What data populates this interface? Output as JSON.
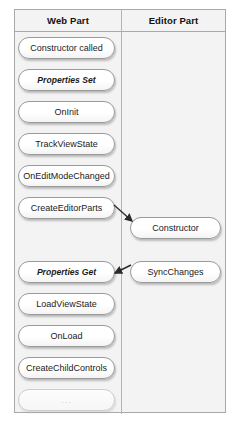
{
  "top_caption_fragment": "",
  "columns": {
    "left_header": "Web Part",
    "right_header": "Editor Part"
  },
  "web_part_steps": [
    {
      "label": "Constructor called",
      "style": "normal",
      "top": 27
    },
    {
      "label": "Properties Set",
      "style": "italic",
      "top": 59
    },
    {
      "label": "OnInit",
      "style": "normal",
      "top": 91
    },
    {
      "label": "TrackViewState",
      "style": "normal",
      "top": 123
    },
    {
      "label": "OnEditModeChanged",
      "style": "normal",
      "top": 155
    },
    {
      "label": "CreateEditorParts",
      "style": "normal",
      "top": 187
    },
    {
      "label": "Properties Get",
      "style": "italic",
      "top": 251
    },
    {
      "label": "LoadViewState",
      "style": "normal",
      "top": 283
    },
    {
      "label": "OnLoad",
      "style": "normal",
      "top": 315
    },
    {
      "label": "CreateChildControls",
      "style": "normal",
      "top": 347
    },
    {
      "label": "...",
      "style": "faded",
      "top": 379
    }
  ],
  "editor_part_steps": [
    {
      "label": "Constructor",
      "top": 207
    },
    {
      "label": "SyncChanges",
      "top": 251
    }
  ],
  "connectors": [
    {
      "name": "create-editor-parts-to-constructor",
      "from": "CreateEditorParts",
      "to": "Constructor",
      "direction": "right"
    },
    {
      "name": "sync-changes-to-properties-get",
      "from": "SyncChanges",
      "to": "Properties Get",
      "direction": "left"
    }
  ],
  "colors": {
    "border": "#a9a9a9",
    "pill_border": "#9a9a9a",
    "cell_background": "#f3f3f3",
    "text": "#1a1a1a",
    "faded_text": "#cfcfcf"
  }
}
